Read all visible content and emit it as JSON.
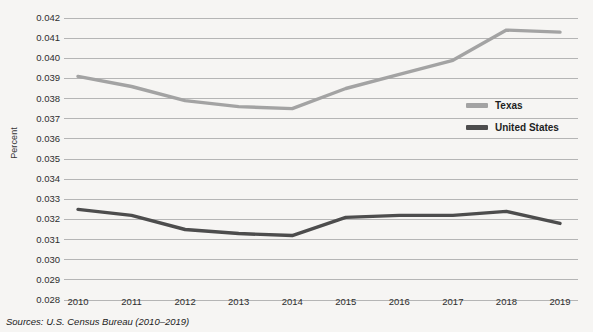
{
  "chart_data": {
    "type": "line",
    "title": "",
    "xlabel": "",
    "ylabel": "Percent",
    "categories": [
      "2010",
      "2011",
      "2012",
      "2013",
      "2014",
      "2015",
      "2016",
      "2017",
      "2018",
      "2019"
    ],
    "x": [
      2010,
      2011,
      2012,
      2013,
      2014,
      2015,
      2016,
      2017,
      2018,
      2019
    ],
    "series": [
      {
        "name": "Texas",
        "color": "#a3a3a3",
        "values": [
          0.0391,
          0.0386,
          0.0379,
          0.0376,
          0.0375,
          0.0385,
          0.0392,
          0.0399,
          0.0414,
          0.0413
        ]
      },
      {
        "name": "United States",
        "color": "#4d4d4d",
        "values": [
          0.0325,
          0.0322,
          0.0315,
          0.0313,
          0.0312,
          0.0321,
          0.0322,
          0.0322,
          0.0324,
          0.0318
        ]
      }
    ],
    "ylim": [
      0.028,
      0.042
    ],
    "ytick_step": 0.001,
    "ytick_labels": [
      "0.042",
      "0.041",
      "0.040",
      "0.039",
      "0.038",
      "0.037",
      "0.036",
      "0.035",
      "0.034",
      "0.033",
      "0.032",
      "0.031",
      "0.030",
      "0.029",
      "0.028"
    ],
    "ytick_values": [
      0.042,
      0.041,
      0.04,
      0.039,
      0.038,
      0.037,
      0.036,
      0.035,
      0.034,
      0.033,
      0.032,
      0.031,
      0.03,
      0.029,
      0.028
    ],
    "grid": true,
    "grid_color": "#b5b5b5",
    "legend_position": "right-middle"
  },
  "legend": {
    "entries": [
      {
        "label": "Texas"
      },
      {
        "label": "United States"
      }
    ]
  },
  "footer": {
    "source": "Sources: U.S. Census Bureau (2010–2019)"
  },
  "colors": {
    "background": "#f6f5f3",
    "texas": "#a3a3a3",
    "united_states": "#4d4d4d",
    "gridline": "#b5b5b5",
    "text": "#2e2e2e"
  }
}
